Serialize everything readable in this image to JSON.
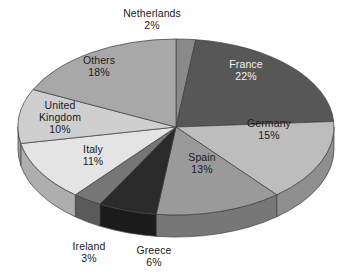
{
  "chart_data": {
    "type": "pie",
    "title": "",
    "categories": [
      "Netherlands",
      "France",
      "Germany",
      "Spain",
      "Greece",
      "Ireland",
      "Italy",
      "United Kingdom",
      "Others"
    ],
    "values": [
      2,
      22,
      15,
      13,
      6,
      3,
      11,
      10,
      18
    ],
    "value_suffix": "%",
    "legend": "none",
    "labels_position": "mixed-inside-outside",
    "three_d": true,
    "start_angle_deg": 0,
    "direction": "clockwise",
    "slice_colors": [
      "#8a8a8a",
      "#575757",
      "#bdbdbd",
      "#9a9a9a",
      "#2a2a2a",
      "#767676",
      "#e4e4e4",
      "#cfcfcf",
      "#a8a8a8"
    ],
    "side_colors": [
      "#6b6b6b",
      "#414141",
      "#8f8f8f",
      "#777777",
      "#1b1b1b",
      "#5a5a5a",
      "#aeaeae",
      "#9c9c9c",
      "#808080"
    ]
  },
  "slices": [
    {
      "name": "Netherlands",
      "pct": "2%",
      "label_name": "Netherlands",
      "label_pct": "2%"
    },
    {
      "name": "France",
      "pct": "22%",
      "label_name": "France",
      "label_pct": "22%"
    },
    {
      "name": "Germany",
      "pct": "15%",
      "label_name": "Germany",
      "label_pct": "15%"
    },
    {
      "name": "Spain",
      "pct": "13%",
      "label_name": "Spain",
      "label_pct": "13%"
    },
    {
      "name": "Greece",
      "pct": "6%",
      "label_name": "Greece",
      "label_pct": "6%"
    },
    {
      "name": "Ireland",
      "pct": "3%",
      "label_name": "Ireland",
      "label_pct": "3%"
    },
    {
      "name": "Italy",
      "pct": "11%",
      "label_name": "Italy",
      "label_pct": "11%"
    },
    {
      "name": "UnitedKingdom",
      "pct": "10%",
      "label_name": "United\nKingdom",
      "label_name_line1": "United",
      "label_name_line2": "Kingdom",
      "label_pct": "10%"
    },
    {
      "name": "Others",
      "pct": "18%",
      "label_name": "Others",
      "label_pct": "18%"
    }
  ],
  "colors": {
    "background": "#ffffff",
    "text_dark": "#1a1a1a",
    "text_light": "#f2f2f2",
    "outline": "#3c3c3c"
  }
}
